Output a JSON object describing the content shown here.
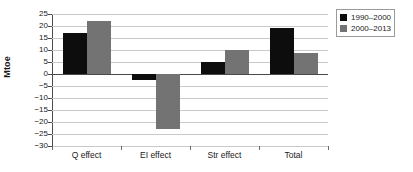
{
  "chart_data": {
    "type": "bar",
    "title": "",
    "xlabel": "",
    "ylabel": "Mtoe",
    "categories": [
      "Q effect",
      "EI effect",
      "Str effect",
      "Total"
    ],
    "series": [
      {
        "name": "1990–2000",
        "color": "#0d0d0d",
        "values": [
          17,
          -2.5,
          5,
          19.3
        ]
      },
      {
        "name": "2000–2013",
        "color": "#737373",
        "values": [
          22,
          -23,
          9.8,
          8.8
        ]
      }
    ],
    "ylim": [
      -30,
      25
    ],
    "ytick_step": 5,
    "ytick_labels": [
      "25",
      "20",
      "15",
      "10",
      "5",
      "0",
      "−5",
      "−10",
      "−15",
      "−20",
      "−25",
      "−30"
    ],
    "grid": true,
    "legend_position": "right-top"
  },
  "legend": {
    "entries": [
      {
        "label": "1990–2000"
      },
      {
        "label": "2000–2013"
      }
    ]
  },
  "axes": {
    "y_title": "Mtoe"
  }
}
